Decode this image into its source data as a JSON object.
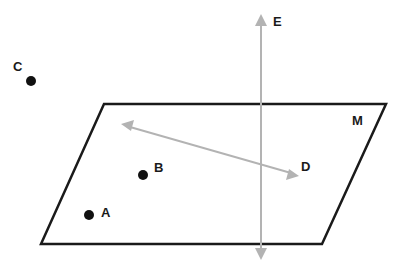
{
  "diagram": {
    "plane": {
      "label": "M",
      "points": "104,104 386,104 322,244 41,244",
      "stroke": "#1a1a1a"
    },
    "line_e": {
      "label": "E",
      "x": 261,
      "y1": 16,
      "y2": 258,
      "color": "#b3b3b3"
    },
    "line_d": {
      "label": "D",
      "x1": 124,
      "y1": 125,
      "x2": 297,
      "y2": 175,
      "color": "#b3b3b3"
    },
    "points": [
      {
        "label": "C",
        "cx": 31,
        "cy": 81
      },
      {
        "label": "B",
        "cx": 143,
        "cy": 175
      },
      {
        "label": "A",
        "cx": 89,
        "cy": 215
      }
    ],
    "point_color": "#111111"
  }
}
